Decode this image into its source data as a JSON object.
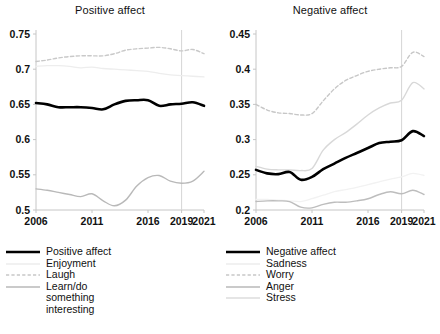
{
  "chart_data": [
    {
      "type": "line",
      "panel": "left",
      "title": "Positive affect",
      "xlabel": "",
      "ylabel": "",
      "xlim": [
        2006,
        2021
      ],
      "ylim": [
        0.5,
        0.75
      ],
      "xticks": [
        2006,
        2011,
        2016,
        2019,
        2021
      ],
      "xtick_labels": [
        "2006",
        "2011",
        "2016",
        "2019",
        "2021"
      ],
      "yticks": [
        0.5,
        0.55,
        0.6,
        0.65,
        0.7,
        0.75
      ],
      "ytick_labels": [
        "0.5",
        "0.55",
        "0.6",
        "0.65",
        "0.7",
        "0.75"
      ],
      "grid": false,
      "legend_position": "below",
      "vline": 2019,
      "x": [
        2006,
        2007,
        2008,
        2009,
        2010,
        2011,
        2012,
        2013,
        2014,
        2015,
        2016,
        2017,
        2018,
        2019,
        2020,
        2021
      ],
      "series": [
        {
          "name": "Positive affect",
          "color": "#000000",
          "style": "solid",
          "width": 2.6,
          "values": [
            0.652,
            0.65,
            0.646,
            0.646,
            0.646,
            0.645,
            0.643,
            0.65,
            0.655,
            0.656,
            0.656,
            0.648,
            0.65,
            0.651,
            0.653,
            0.648
          ]
        },
        {
          "name": "Enjoyment",
          "color": "#ededed",
          "style": "solid",
          "width": 1.3,
          "values": [
            0.704,
            0.705,
            0.705,
            0.704,
            0.702,
            0.703,
            0.701,
            0.7,
            0.699,
            0.698,
            0.697,
            0.694,
            0.692,
            0.691,
            0.69,
            0.689
          ]
        },
        {
          "name": "Laugh",
          "color": "#c9c9c9",
          "style": "dashed",
          "width": 1.4,
          "values": [
            0.711,
            0.713,
            0.716,
            0.718,
            0.719,
            0.719,
            0.719,
            0.722,
            0.727,
            0.729,
            0.73,
            0.731,
            0.729,
            0.726,
            0.728,
            0.722
          ]
        },
        {
          "name": "Learn/do something interesting",
          "color": "#b9b9b9",
          "style": "solid",
          "width": 1.4,
          "values": [
            0.53,
            0.528,
            0.525,
            0.522,
            0.519,
            0.523,
            0.513,
            0.506,
            0.514,
            0.534,
            0.546,
            0.549,
            0.541,
            0.538,
            0.541,
            0.555
          ]
        }
      ]
    },
    {
      "type": "line",
      "panel": "right",
      "title": "Negative affect",
      "xlabel": "",
      "ylabel": "",
      "xlim": [
        2006,
        2021
      ],
      "ylim": [
        0.2,
        0.45
      ],
      "xticks": [
        2006,
        2011,
        2016,
        2019,
        2021
      ],
      "xtick_labels": [
        "2006",
        "2011",
        "2016",
        "2019",
        "2021"
      ],
      "yticks": [
        0.2,
        0.25,
        0.3,
        0.35,
        0.4,
        0.45
      ],
      "ytick_labels": [
        "0.2",
        "0.25",
        "0.3",
        "0.35",
        "0.4",
        "0.45"
      ],
      "grid": false,
      "legend_position": "below",
      "vline": 2019,
      "x": [
        2006,
        2007,
        2008,
        2009,
        2010,
        2011,
        2012,
        2013,
        2014,
        2015,
        2016,
        2017,
        2018,
        2019,
        2020,
        2021
      ],
      "series": [
        {
          "name": "Negative affect",
          "color": "#000000",
          "style": "solid",
          "width": 2.6,
          "values": [
            0.257,
            0.252,
            0.251,
            0.254,
            0.243,
            0.247,
            0.258,
            0.266,
            0.274,
            0.281,
            0.288,
            0.295,
            0.297,
            0.299,
            0.312,
            0.305
          ]
        },
        {
          "name": "Sadness",
          "color": "#f2f2f2",
          "style": "solid",
          "width": 1.3,
          "values": [
            0.215,
            0.215,
            0.214,
            0.213,
            0.212,
            0.216,
            0.221,
            0.226,
            0.229,
            0.232,
            0.236,
            0.24,
            0.244,
            0.247,
            0.252,
            0.249
          ]
        },
        {
          "name": "Worry",
          "color": "#c7c7c7",
          "style": "dashed",
          "width": 1.4,
          "values": [
            0.35,
            0.342,
            0.338,
            0.337,
            0.335,
            0.337,
            0.355,
            0.372,
            0.384,
            0.391,
            0.397,
            0.4,
            0.402,
            0.404,
            0.424,
            0.418
          ]
        },
        {
          "name": "Anger",
          "color": "#bdbdbd",
          "style": "solid",
          "width": 1.4,
          "values": [
            0.212,
            0.213,
            0.213,
            0.212,
            0.204,
            0.203,
            0.208,
            0.211,
            0.211,
            0.213,
            0.216,
            0.222,
            0.226,
            0.223,
            0.228,
            0.222
          ]
        },
        {
          "name": "Stress",
          "color": "#d8d8d8",
          "style": "solid",
          "width": 1.4,
          "values": [
            0.262,
            0.258,
            0.257,
            0.257,
            0.256,
            0.259,
            0.285,
            0.3,
            0.31,
            0.322,
            0.335,
            0.345,
            0.352,
            0.356,
            0.381,
            0.372
          ]
        }
      ]
    }
  ],
  "panels": {
    "left": {
      "title": "Positive affect",
      "legend": [
        {
          "label": "Positive affect",
          "key": "solid-black"
        },
        {
          "label": "Enjoyment",
          "key": "solid-vlight"
        },
        {
          "label": "Laugh",
          "key": "dashed-light"
        },
        {
          "label": "Learn/do\nsomething\ninteresting",
          "key": "solid-light"
        }
      ]
    },
    "right": {
      "title": "Negative affect",
      "legend": [
        {
          "label": "Negative affect",
          "key": "solid-black"
        },
        {
          "label": "Sadness",
          "key": "solid-vlight"
        },
        {
          "label": "Worry",
          "key": "dashed-light"
        },
        {
          "label": "Anger",
          "key": "solid-light"
        },
        {
          "label": "Stress",
          "key": "solid-vlight2"
        }
      ]
    }
  },
  "colors": {
    "axis": "#c6c6c6",
    "text": "#111111",
    "vline": "#d5d5d5",
    "black": "#000000"
  }
}
